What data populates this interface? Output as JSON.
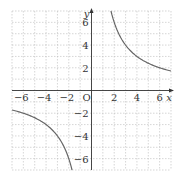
{
  "chart_data": {
    "type": "line",
    "title": "",
    "function": "y = 12/x",
    "xlabel": "x",
    "ylabel": "y",
    "origin_label": "O",
    "xlim": [
      -7,
      7
    ],
    "ylim": [
      -7,
      7
    ],
    "grid": true,
    "grid_step": 1,
    "x_ticks": [
      -6,
      -4,
      -2,
      2,
      4,
      6
    ],
    "x_tick_labels": [
      "−6",
      "−4",
      "−2",
      "2",
      "4",
      "6"
    ],
    "y_ticks": [
      6,
      4,
      2,
      -2,
      -4,
      -6
    ],
    "y_tick_labels": [
      "6",
      "4",
      "2",
      "−2",
      "−4",
      "−6"
    ],
    "series": [
      {
        "name": "y = 12/x (first quadrant branch)",
        "x": [
          1.714,
          2,
          3,
          4,
          5,
          6,
          7
        ],
        "y": [
          7,
          6,
          4,
          3,
          2.4,
          2,
          1.714
        ]
      },
      {
        "name": "y = 12/x (third quadrant branch)",
        "x": [
          -7,
          -6,
          -5,
          -4,
          -3,
          -2,
          -1.714
        ],
        "y": [
          -1.714,
          -2,
          -2.4,
          -3,
          -4,
          -6,
          -7
        ]
      }
    ],
    "colors": {
      "curve": "#666666",
      "axis": "#333333",
      "grid": "#bbbbbb"
    }
  }
}
